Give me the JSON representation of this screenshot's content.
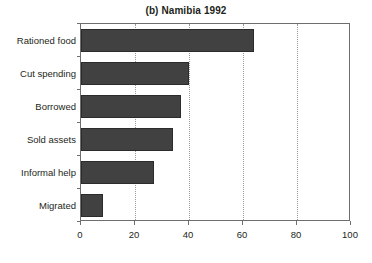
{
  "chart_data": {
    "type": "bar",
    "orientation": "horizontal",
    "title": "(b) Namibia 1992",
    "xlabel": "",
    "ylabel": "",
    "categories": [
      "Rationed food",
      "Cut spending",
      "Borrowed",
      "Sold assets",
      "Informal help",
      "Migrated"
    ],
    "values": [
      64,
      40,
      37,
      34,
      27,
      8
    ],
    "series": [
      {
        "name": "Namibia 1992",
        "values": [
          64,
          40,
          37,
          34,
          27,
          8
        ]
      }
    ],
    "xlim": [
      0,
      100
    ],
    "xticks": [
      0,
      20,
      40,
      60,
      80,
      100
    ],
    "xtick_labels": [
      "0",
      "20",
      "40",
      "60",
      "80",
      "100"
    ],
    "grid": "vertical-dotted",
    "legend": null,
    "bar_color": "#414141",
    "bar_edge_color": "#2b2b2b",
    "axis_color": "#6e6e6e",
    "gridline_color": "#9a9a9a",
    "background": "#ffffff",
    "text_color": "#231f20"
  }
}
